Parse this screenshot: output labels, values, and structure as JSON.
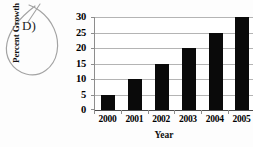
{
  "annotation": {
    "choice_label": "D)",
    "mark_type": "hand-drawn-ellipse"
  },
  "colors": {
    "bar": "#0a0a0a",
    "gridline": "#b4b4b4",
    "axis": "#4a4a4a",
    "background": "#fdfdfd",
    "text": "#000000",
    "ink": "#9a9a9a"
  },
  "chart_data": {
    "type": "bar",
    "title": "",
    "xlabel": "Year",
    "ylabel": "Percent Growth",
    "categories": [
      "2000",
      "2001",
      "2002",
      "2003",
      "2004",
      "2005"
    ],
    "values": [
      5,
      10,
      15,
      20,
      25,
      30
    ],
    "ylim": [
      0,
      30
    ],
    "yticks": [
      0,
      5,
      10,
      15,
      20,
      25,
      30
    ],
    "ytick_labels": [
      "0",
      "5",
      "10",
      "15",
      "20",
      "25",
      "30"
    ],
    "grid": true,
    "legend": false,
    "legend_position": "none"
  }
}
